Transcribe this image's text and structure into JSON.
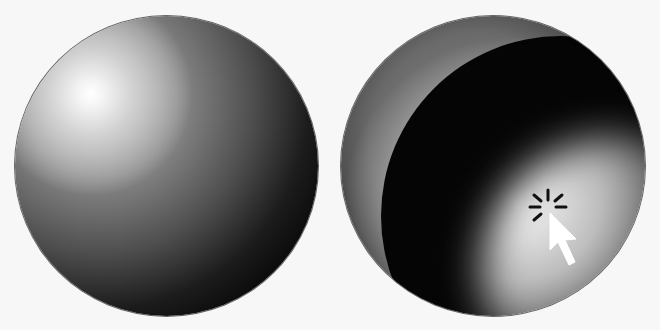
{
  "scene": {
    "background_color": "#f7f7f7",
    "spheres": [
      {
        "id": "left",
        "description": "Sphere lit from top-left with specular highlight",
        "highlight": "top-left"
      },
      {
        "id": "right",
        "description": "Sphere with light positioned at cursor location",
        "highlight": "bottom-right",
        "cursor": "click-arrow-icon"
      }
    ],
    "colors": {
      "dark": "#050505",
      "highlight": "#ffffff",
      "mid": "#8a8a8a"
    }
  }
}
